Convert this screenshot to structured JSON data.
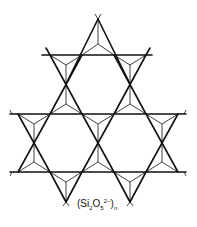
{
  "diagram": {
    "formula": {
      "open": "(Si",
      "si_sub": "2",
      "o": "O",
      "o_sub": "5",
      "charge": "2−",
      "close": ")",
      "n_sub": "n"
    },
    "colors": {
      "line": "#111111",
      "background": "#ffffff"
    },
    "tetrahedra_up": [
      [
        98,
        19
      ],
      [
        50,
        55
      ],
      [
        146,
        55
      ],
      [
        50,
        84
      ],
      [
        146,
        84
      ],
      [
        18,
        114
      ],
      [
        82,
        114
      ],
      [
        114,
        114
      ],
      [
        178,
        114
      ],
      [
        18,
        143
      ],
      [
        82,
        143
      ],
      [
        114,
        143
      ],
      [
        178,
        143
      ],
      [
        66,
        172
      ],
      [
        130,
        172
      ]
    ]
  }
}
